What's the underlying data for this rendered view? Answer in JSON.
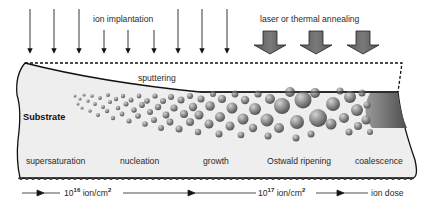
{
  "diagram": {
    "type": "ion-beam nanoparticle formation process",
    "top_labels": {
      "ion_implantation": "ion implantation",
      "annealing": "laser or thermal annealing"
    },
    "substrate": {
      "label": "Substrate",
      "surface_label": "sputtering"
    },
    "stages": [
      {
        "label": "supersaturation"
      },
      {
        "label": "nucleation"
      },
      {
        "label": "growth"
      },
      {
        "label": "Ostwald ripening"
      },
      {
        "label": "coalescence"
      }
    ],
    "dose_axis": {
      "mark1_base": "10",
      "mark1_exp": "16",
      "mark1_unit": " ion/cm",
      "mark1_unit_exp": "2",
      "mark2_base": "10",
      "mark2_exp": "17",
      "mark2_unit": " ion/cm",
      "mark2_unit_exp": "2",
      "end_label": "ion dose"
    },
    "colors": {
      "substrate_fill": "#eeeeee",
      "outline": "#111111",
      "particle_dark": "#6e6e6e",
      "particle_light": "#c8c8c8",
      "anneal_arrow": "#6a6a6a"
    },
    "ion_arrows": {
      "long_count": 8,
      "short_count": 3
    },
    "anneal_arrows": {
      "count": 3
    }
  }
}
